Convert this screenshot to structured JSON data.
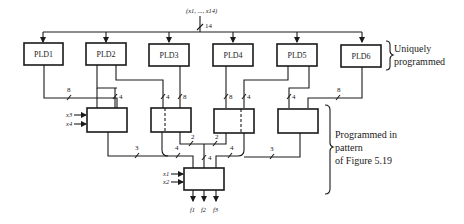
{
  "diagram": {
    "input_bus": {
      "label": "(x1, ..., x14)",
      "width": "14"
    },
    "plds": [
      {
        "id": "pld1",
        "label": "PLD1"
      },
      {
        "id": "pld2",
        "label": "PLD2"
      },
      {
        "id": "pld3",
        "label": "PLD3"
      },
      {
        "id": "pld4",
        "label": "PLD4"
      },
      {
        "id": "pld5",
        "label": "PLD5"
      },
      {
        "id": "pld6",
        "label": "PLD6"
      }
    ],
    "bus_widths": {
      "pld1_out": "8",
      "pld2_to_b1": "4",
      "pld2_to_b2": "4",
      "pld3_to_b2": "8",
      "pld4_to_b3": "8",
      "pld5_to_b3": "4",
      "pld5_to_b4": "4",
      "pld6_out": "8",
      "b2_to_mid": "2",
      "b3_to_mid": "2",
      "mid_to_final": "4",
      "b1_out": "3",
      "b2_out": "4",
      "b3_out": "4",
      "b4_out": "3"
    },
    "side_inputs": {
      "b1": [
        "x3",
        "x4"
      ],
      "final": [
        "x1",
        "x2"
      ]
    },
    "outputs": [
      "f1",
      "f2",
      "f3"
    ],
    "annotations": {
      "top_brace": [
        "Uniquely",
        "programmed"
      ],
      "bottom_brace": [
        "Programmed in",
        "pattern",
        "of Figure 5.19"
      ]
    }
  }
}
